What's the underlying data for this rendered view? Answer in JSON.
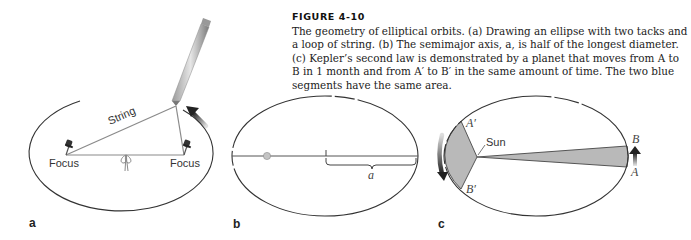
{
  "figure": {
    "title": "FIGURE 4-10",
    "caption": "The geometry of elliptical orbits. (a) Drawing an ellipse with two tacks and a loop of string. (b) The semimajor axis, a, is half of the longest diameter. (c) Kepler’s second law is demonstrated by a planet that moves from A to B in 1 month and from A′ to B′ in the same amount of time. The two blue segments have the same area."
  },
  "panels": {
    "a": {
      "label": "a",
      "string_label": "String",
      "focus_left_label": "Focus",
      "focus_right_label": "Focus",
      "icons": [
        "pencil-icon",
        "pushpin-icon",
        "pushpin-icon",
        "knot-icon",
        "motion-arrow-icon"
      ]
    },
    "b": {
      "label": "b",
      "semimajor_label": "a",
      "icons": [
        "focus-dot-icon",
        "brace-icon"
      ]
    },
    "c": {
      "label": "c",
      "sun_label": "Sun",
      "point_a_prime": "A′",
      "point_b_prime": "B′",
      "point_a": "A",
      "point_b": "B",
      "icons": [
        "motion-arrow-down-icon",
        "motion-arrow-up-icon"
      ]
    }
  },
  "colors": {
    "segment_fill": "#b9b9b9",
    "line": "#444444",
    "string": "#8a8a8a",
    "arrow": "#222222"
  }
}
